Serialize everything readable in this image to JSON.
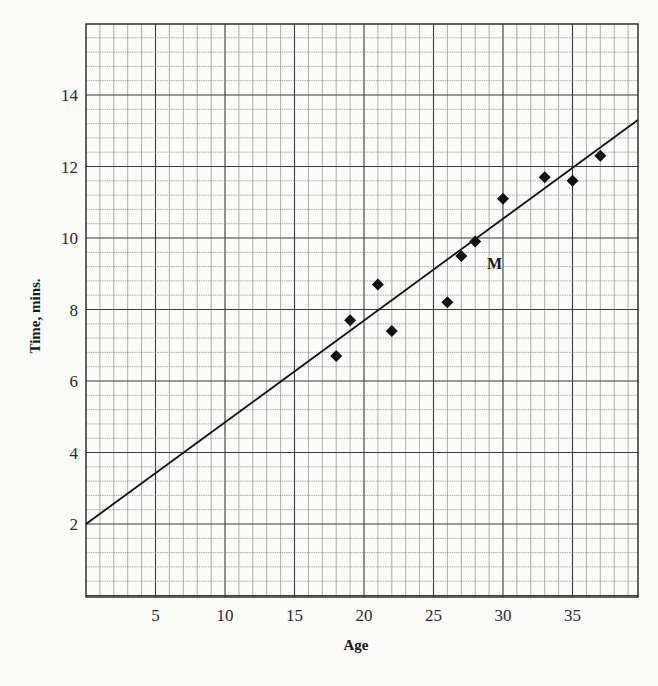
{
  "chart_data": {
    "type": "scatter",
    "title": "",
    "xlabel": "Age",
    "ylabel": "Time, mins.",
    "xlim": [
      0,
      39.7
    ],
    "ylim": [
      -0.2,
      15.8
    ],
    "x_ticks": [
      5,
      10,
      15,
      20,
      25,
      30,
      35
    ],
    "y_ticks": [
      2,
      4,
      6,
      8,
      10,
      12,
      14
    ],
    "grid": true,
    "grid_style": "graph paper: minor lines every 1 year (x) and 0.4 min (y), major every 5 years and 2 min",
    "legend": null,
    "series": [
      {
        "name": "observations",
        "marker": "diamond",
        "points": [
          {
            "x": 18,
            "y": 6.7
          },
          {
            "x": 19,
            "y": 7.7
          },
          {
            "x": 21,
            "y": 8.7
          },
          {
            "x": 22,
            "y": 7.4
          },
          {
            "x": 26,
            "y": 8.2
          },
          {
            "x": 27,
            "y": 9.5
          },
          {
            "x": 28,
            "y": 9.9
          },
          {
            "x": 30,
            "y": 11.1
          },
          {
            "x": 33,
            "y": 11.7
          },
          {
            "x": 35,
            "y": 11.6
          },
          {
            "x": 37,
            "y": 12.3
          }
        ]
      },
      {
        "name": "line of best fit",
        "type": "line",
        "points": [
          {
            "x": 0,
            "y": 2.0
          },
          {
            "x": 39.7,
            "y": 13.3
          }
        ]
      }
    ],
    "annotations": [
      {
        "text": "M",
        "x": 28.7,
        "y": 9.3
      }
    ]
  },
  "colors": {
    "background": "#fbfbf9",
    "grid_major": "#3a3a3a",
    "grid_minor": "#8a8a8a",
    "ink": "#111111"
  }
}
